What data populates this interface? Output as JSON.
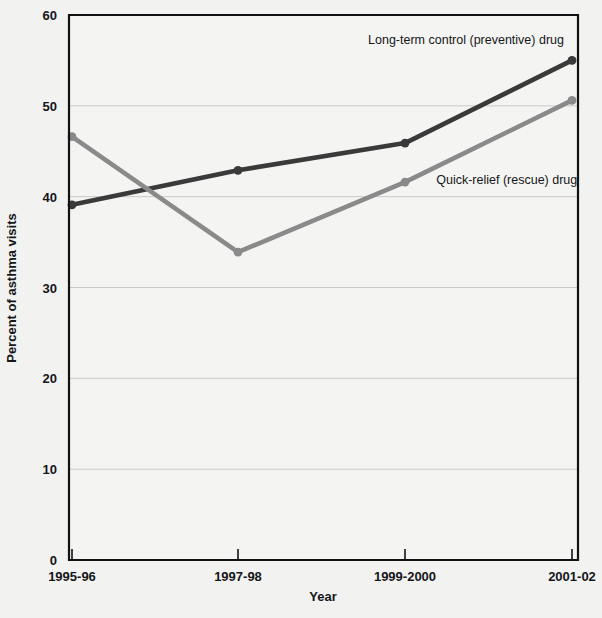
{
  "chart_data": {
    "type": "line",
    "title": "",
    "xlabel": "Year",
    "ylabel": "Percent of asthma visits",
    "categories": [
      "1995-96",
      "1997-98",
      "1999-2000",
      "2001-02"
    ],
    "ylim": [
      0,
      60
    ],
    "yticks": [
      0,
      10,
      20,
      30,
      40,
      50,
      60
    ],
    "ytick_labels": [
      "0",
      "10",
      "20",
      "30",
      "40",
      "50",
      "60"
    ],
    "grid": true,
    "legend_position": "inline-annotation",
    "series": [
      {
        "name": "Long-term control (preventive) drug",
        "color": "#3a3a3a",
        "values": [
          39.1,
          42.9,
          45.9,
          55.0
        ],
        "label_x_frac": 0.78,
        "label_y_value": 57.2
      },
      {
        "name": "Quick-relief (rescue) drug",
        "color": "#8a8a8a",
        "values": [
          46.6,
          33.9,
          41.6,
          50.6
        ],
        "label_x_frac": 0.86,
        "label_y_value": 41.8
      }
    ]
  },
  "axes": {
    "x_axis_title": "Year",
    "y_axis_title": "Percent of asthma visits",
    "y_labels": [
      "60",
      "50",
      "40",
      "30",
      "20",
      "10",
      "0"
    ],
    "x_labels": [
      "1995-96",
      "1997-98",
      "1999-2000",
      "2001-02"
    ]
  },
  "annotations": {
    "series_1_label": "Long-term control (preventive) drug",
    "series_2_label": "Quick-relief (rescue) drug"
  },
  "colors": {
    "series_1": "#3a3a3a",
    "series_2": "#8a8a8a",
    "axis": "#111214",
    "grid": "#c9c9c9",
    "background": "#f2f2f0"
  }
}
